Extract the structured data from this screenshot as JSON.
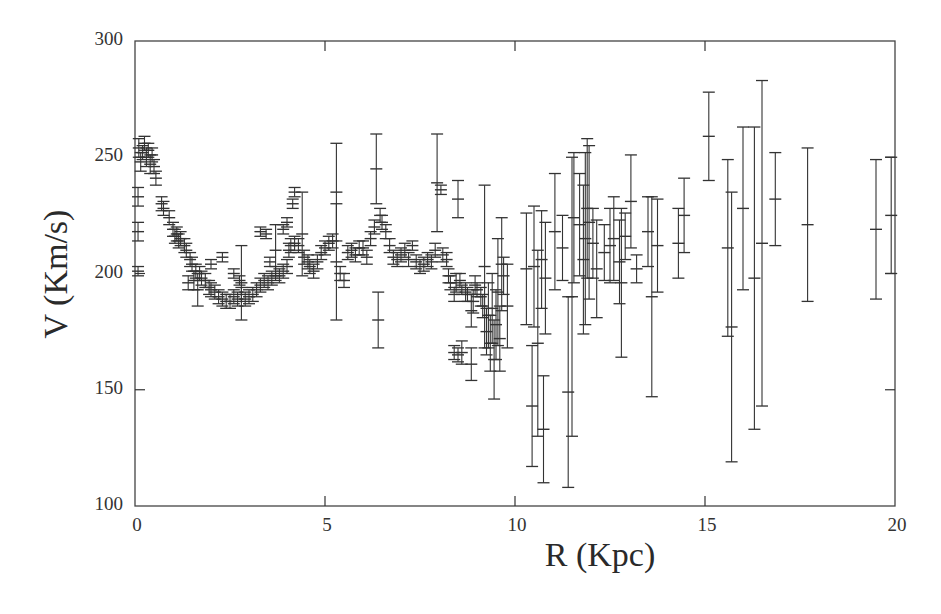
{
  "chart_data": {
    "type": "scatter",
    "title": "",
    "xlabel": "R (Kpc)",
    "ylabel": "V (Km/s)",
    "xlim": [
      0,
      20
    ],
    "ylim": [
      100,
      300
    ],
    "xticks": [
      0,
      5,
      10,
      15,
      20
    ],
    "yticks": [
      100,
      150,
      200,
      250,
      300
    ],
    "grid": false,
    "legend": null,
    "marker": "cross with error bars",
    "color": "#333333",
    "series": [
      {
        "name": "Rotation curve",
        "points": [
          {
            "r": 0.1,
            "v": 254,
            "err": 4
          },
          {
            "r": 0.15,
            "v": 248,
            "err": 4
          },
          {
            "r": 0.2,
            "v": 252,
            "err": 3
          },
          {
            "r": 0.25,
            "v": 256,
            "err": 3
          },
          {
            "r": 0.3,
            "v": 250,
            "err": 4
          },
          {
            "r": 0.35,
            "v": 253,
            "err": 3
          },
          {
            "r": 0.4,
            "v": 247,
            "err": 4
          },
          {
            "r": 0.45,
            "v": 251,
            "err": 3
          },
          {
            "r": 0.5,
            "v": 246,
            "err": 3
          },
          {
            "r": 0.08,
            "v": 233,
            "err": 4
          },
          {
            "r": 0.08,
            "v": 218,
            "err": 4
          },
          {
            "r": 0.08,
            "v": 201,
            "err": 2
          },
          {
            "r": 0.55,
            "v": 241,
            "err": 3
          },
          {
            "r": 0.7,
            "v": 230,
            "err": 3
          },
          {
            "r": 0.75,
            "v": 228,
            "err": 3
          },
          {
            "r": 0.9,
            "v": 224,
            "err": 3
          },
          {
            "r": 1.0,
            "v": 219,
            "err": 3
          },
          {
            "r": 1.05,
            "v": 216,
            "err": 3
          },
          {
            "r": 1.1,
            "v": 217,
            "err": 3
          },
          {
            "r": 1.15,
            "v": 214,
            "err": 3
          },
          {
            "r": 1.2,
            "v": 215,
            "err": 3
          },
          {
            "r": 1.3,
            "v": 212,
            "err": 3
          },
          {
            "r": 1.35,
            "v": 210,
            "err": 3
          },
          {
            "r": 1.45,
            "v": 206,
            "err": 3
          },
          {
            "r": 1.5,
            "v": 204,
            "err": 3
          },
          {
            "r": 1.6,
            "v": 201,
            "err": 3
          },
          {
            "r": 1.7,
            "v": 200,
            "err": 3
          },
          {
            "r": 1.75,
            "v": 198,
            "err": 3
          },
          {
            "r": 1.4,
            "v": 196,
            "err": 3
          },
          {
            "r": 1.55,
            "v": 197,
            "err": 4
          },
          {
            "r": 1.65,
            "v": 193,
            "err": 7
          },
          {
            "r": 1.85,
            "v": 197,
            "err": 3
          },
          {
            "r": 1.95,
            "v": 194,
            "err": 3
          },
          {
            "r": 2.0,
            "v": 193,
            "err": 3
          },
          {
            "r": 2.1,
            "v": 192,
            "err": 3
          },
          {
            "r": 2.2,
            "v": 190,
            "err": 3
          },
          {
            "r": 2.3,
            "v": 189,
            "err": 3
          },
          {
            "r": 2.4,
            "v": 188,
            "err": 3
          },
          {
            "r": 2.5,
            "v": 188,
            "err": 3
          },
          {
            "r": 2.6,
            "v": 190,
            "err": 3
          },
          {
            "r": 2.7,
            "v": 189,
            "err": 3
          },
          {
            "r": 2.8,
            "v": 191,
            "err": 3
          },
          {
            "r": 2.9,
            "v": 189,
            "err": 3
          },
          {
            "r": 3.0,
            "v": 190,
            "err": 3
          },
          {
            "r": 3.1,
            "v": 191,
            "err": 3
          },
          {
            "r": 2.8,
            "v": 196,
            "err": 16
          },
          {
            "r": 2.0,
            "v": 204,
            "err": 2
          },
          {
            "r": 2.3,
            "v": 207,
            "err": 2
          },
          {
            "r": 2.6,
            "v": 200,
            "err": 2
          },
          {
            "r": 2.75,
            "v": 197,
            "err": 2
          },
          {
            "r": 3.2,
            "v": 193,
            "err": 3
          },
          {
            "r": 3.3,
            "v": 195,
            "err": 3
          },
          {
            "r": 3.4,
            "v": 197,
            "err": 3
          },
          {
            "r": 3.5,
            "v": 196,
            "err": 3
          },
          {
            "r": 3.6,
            "v": 198,
            "err": 3
          },
          {
            "r": 3.7,
            "v": 200,
            "err": 3
          },
          {
            "r": 3.8,
            "v": 199,
            "err": 3
          },
          {
            "r": 3.9,
            "v": 201,
            "err": 3
          },
          {
            "r": 4.0,
            "v": 203,
            "err": 3
          },
          {
            "r": 3.3,
            "v": 218,
            "err": 2
          },
          {
            "r": 3.45,
            "v": 217,
            "err": 2
          },
          {
            "r": 3.55,
            "v": 205,
            "err": 2
          },
          {
            "r": 3.7,
            "v": 210,
            "err": 11
          },
          {
            "r": 3.9,
            "v": 219,
            "err": 2
          },
          {
            "r": 4.0,
            "v": 222,
            "err": 2
          },
          {
            "r": 4.15,
            "v": 230,
            "err": 2
          },
          {
            "r": 4.2,
            "v": 235,
            "err": 2
          },
          {
            "r": 4.05,
            "v": 210,
            "err": 3
          },
          {
            "r": 4.1,
            "v": 212,
            "err": 3
          },
          {
            "r": 4.2,
            "v": 213,
            "err": 3
          },
          {
            "r": 4.3,
            "v": 212,
            "err": 3
          },
          {
            "r": 4.4,
            "v": 217,
            "err": 18
          },
          {
            "r": 4.45,
            "v": 207,
            "err": 3
          },
          {
            "r": 4.55,
            "v": 205,
            "err": 3
          },
          {
            "r": 4.6,
            "v": 203,
            "err": 3
          },
          {
            "r": 4.7,
            "v": 201,
            "err": 3
          },
          {
            "r": 4.8,
            "v": 205,
            "err": 3
          },
          {
            "r": 4.9,
            "v": 209,
            "err": 3
          },
          {
            "r": 5.0,
            "v": 211,
            "err": 3
          },
          {
            "r": 5.1,
            "v": 213,
            "err": 3
          },
          {
            "r": 5.2,
            "v": 214,
            "err": 3
          },
          {
            "r": 5.3,
            "v": 235,
            "err": 21
          },
          {
            "r": 5.3,
            "v": 205,
            "err": 25
          },
          {
            "r": 5.4,
            "v": 200,
            "err": 3
          },
          {
            "r": 5.5,
            "v": 197,
            "err": 3
          },
          {
            "r": 5.6,
            "v": 209,
            "err": 3
          },
          {
            "r": 5.7,
            "v": 210,
            "err": 3
          },
          {
            "r": 5.8,
            "v": 208,
            "err": 3
          },
          {
            "r": 5.9,
            "v": 211,
            "err": 3
          },
          {
            "r": 6.0,
            "v": 211,
            "err": 3
          },
          {
            "r": 6.1,
            "v": 207,
            "err": 3
          },
          {
            "r": 6.2,
            "v": 215,
            "err": 3
          },
          {
            "r": 6.3,
            "v": 220,
            "err": 3
          },
          {
            "r": 6.35,
            "v": 245,
            "err": 15
          },
          {
            "r": 6.4,
            "v": 180,
            "err": 12
          },
          {
            "r": 6.45,
            "v": 225,
            "err": 3
          },
          {
            "r": 6.5,
            "v": 222,
            "err": 3
          },
          {
            "r": 6.6,
            "v": 218,
            "err": 3
          },
          {
            "r": 6.7,
            "v": 212,
            "err": 3
          },
          {
            "r": 6.8,
            "v": 207,
            "err": 3
          },
          {
            "r": 6.9,
            "v": 206,
            "err": 3
          },
          {
            "r": 7.0,
            "v": 208,
            "err": 3
          },
          {
            "r": 7.1,
            "v": 210,
            "err": 3
          },
          {
            "r": 7.2,
            "v": 206,
            "err": 3
          },
          {
            "r": 7.3,
            "v": 212,
            "err": 2
          },
          {
            "r": 7.4,
            "v": 205,
            "err": 3
          },
          {
            "r": 7.5,
            "v": 203,
            "err": 3
          },
          {
            "r": 7.6,
            "v": 204,
            "err": 3
          },
          {
            "r": 7.7,
            "v": 206,
            "err": 3
          },
          {
            "r": 7.8,
            "v": 205,
            "err": 3
          },
          {
            "r": 7.9,
            "v": 210,
            "err": 3
          },
          {
            "r": 7.95,
            "v": 239,
            "err": 21
          },
          {
            "r": 8.05,
            "v": 236,
            "err": 2
          },
          {
            "r": 8.1,
            "v": 208,
            "err": 3
          },
          {
            "r": 8.2,
            "v": 206,
            "err": 3
          },
          {
            "r": 8.25,
            "v": 199,
            "err": 3
          },
          {
            "r": 8.3,
            "v": 196,
            "err": 3
          },
          {
            "r": 8.4,
            "v": 191,
            "err": 3
          },
          {
            "r": 8.45,
            "v": 196,
            "err": 4
          },
          {
            "r": 8.5,
            "v": 232,
            "err": 8
          },
          {
            "r": 8.55,
            "v": 197,
            "err": 3
          },
          {
            "r": 8.6,
            "v": 193,
            "err": 2
          },
          {
            "r": 8.7,
            "v": 192,
            "err": 4
          },
          {
            "r": 8.75,
            "v": 191,
            "err": 3
          },
          {
            "r": 8.85,
            "v": 184,
            "err": 7
          },
          {
            "r": 8.9,
            "v": 188,
            "err": 5
          },
          {
            "r": 8.95,
            "v": 195,
            "err": 4
          },
          {
            "r": 9.0,
            "v": 193,
            "err": 3
          },
          {
            "r": 8.4,
            "v": 166,
            "err": 3
          },
          {
            "r": 8.5,
            "v": 165,
            "err": 3
          },
          {
            "r": 8.6,
            "v": 166,
            "err": 5
          },
          {
            "r": 8.85,
            "v": 161,
            "err": 7
          },
          {
            "r": 9.1,
            "v": 190,
            "err": 4
          },
          {
            "r": 9.15,
            "v": 186,
            "err": 5
          },
          {
            "r": 9.2,
            "v": 203,
            "err": 35
          },
          {
            "r": 9.25,
            "v": 175,
            "err": 10
          },
          {
            "r": 9.3,
            "v": 182,
            "err": 14
          },
          {
            "r": 9.35,
            "v": 170,
            "err": 12
          },
          {
            "r": 9.4,
            "v": 185,
            "err": 15
          },
          {
            "r": 9.45,
            "v": 163,
            "err": 17
          },
          {
            "r": 9.5,
            "v": 178,
            "err": 15
          },
          {
            "r": 9.55,
            "v": 192,
            "err": 23
          },
          {
            "r": 9.6,
            "v": 172,
            "err": 14
          },
          {
            "r": 9.65,
            "v": 204,
            "err": 20
          },
          {
            "r": 9.7,
            "v": 199,
            "err": 8
          },
          {
            "r": 9.8,
            "v": 186,
            "err": 18
          },
          {
            "r": 10.3,
            "v": 202,
            "err": 24
          },
          {
            "r": 10.45,
            "v": 143,
            "err": 26
          },
          {
            "r": 10.5,
            "v": 203,
            "err": 26
          },
          {
            "r": 10.6,
            "v": 170,
            "err": 40
          },
          {
            "r": 10.7,
            "v": 206,
            "err": 21
          },
          {
            "r": 10.75,
            "v": 133,
            "err": 23
          },
          {
            "r": 10.8,
            "v": 198,
            "err": 24
          },
          {
            "r": 11.05,
            "v": 218,
            "err": 25
          },
          {
            "r": 11.25,
            "v": 211,
            "err": 14
          },
          {
            "r": 11.4,
            "v": 149,
            "err": 41
          },
          {
            "r": 11.5,
            "v": 190,
            "err": 60
          },
          {
            "r": 11.55,
            "v": 224,
            "err": 28
          },
          {
            "r": 11.7,
            "v": 221,
            "err": 22
          },
          {
            "r": 11.8,
            "v": 206,
            "err": 32
          },
          {
            "r": 11.85,
            "v": 215,
            "err": 37
          },
          {
            "r": 11.9,
            "v": 228,
            "err": 30
          },
          {
            "r": 11.95,
            "v": 222,
            "err": 33
          },
          {
            "r": 12.05,
            "v": 213,
            "err": 15
          },
          {
            "r": 12.15,
            "v": 202,
            "err": 21
          },
          {
            "r": 12.35,
            "v": 209,
            "err": 12
          },
          {
            "r": 12.5,
            "v": 212,
            "err": 16
          },
          {
            "r": 12.6,
            "v": 215,
            "err": 18
          },
          {
            "r": 12.75,
            "v": 205,
            "err": 18
          },
          {
            "r": 12.8,
            "v": 196,
            "err": 32
          },
          {
            "r": 12.9,
            "v": 216,
            "err": 10
          },
          {
            "r": 13.05,
            "v": 231,
            "err": 20
          },
          {
            "r": 13.2,
            "v": 202,
            "err": 6
          },
          {
            "r": 13.5,
            "v": 218,
            "err": 15
          },
          {
            "r": 13.6,
            "v": 190,
            "err": 43
          },
          {
            "r": 13.75,
            "v": 212,
            "err": 20
          },
          {
            "r": 14.3,
            "v": 213,
            "err": 15
          },
          {
            "r": 14.45,
            "v": 225,
            "err": 16
          },
          {
            "r": 15.1,
            "v": 259,
            "err": 19
          },
          {
            "r": 15.6,
            "v": 211,
            "err": 38
          },
          {
            "r": 15.7,
            "v": 177,
            "err": 58
          },
          {
            "r": 16.0,
            "v": 228,
            "err": 35
          },
          {
            "r": 16.3,
            "v": 198,
            "err": 65
          },
          {
            "r": 16.5,
            "v": 213,
            "err": 70
          },
          {
            "r": 16.85,
            "v": 232,
            "err": 20
          },
          {
            "r": 17.7,
            "v": 221,
            "err": 33
          },
          {
            "r": 19.5,
            "v": 219,
            "err": 30
          },
          {
            "r": 19.9,
            "v": 225,
            "err": 25
          }
        ]
      }
    ]
  }
}
